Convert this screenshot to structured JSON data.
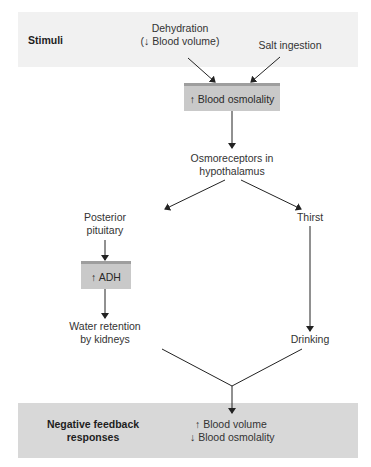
{
  "diagram": {
    "stimuli_band": {
      "label": "Stimuli",
      "items": [
        {
          "line1": "Dehydration",
          "line2": "(↓ Blood volume)"
        },
        {
          "line1": "Salt ingestion"
        }
      ]
    },
    "nodes": {
      "blood_osmolality": "↑ Blood osmolality",
      "osmoreceptors": {
        "line1": "Osmoreceptors in",
        "line2": "hypothalamus"
      },
      "posterior_pituitary": {
        "line1": "Posterior",
        "line2": "pituitary"
      },
      "thirst": "Thirst",
      "adh": "↑ ADH",
      "water_retention": {
        "line1": "Water retention",
        "line2": "by kidneys"
      },
      "drinking": "Drinking"
    },
    "response_band": {
      "label_line1": "Negative feedback",
      "label_line2": "responses",
      "result_line1": "↑ Blood volume",
      "result_line2": "↓ Blood osmolality"
    },
    "colors": {
      "top_band": "#f1f1f1",
      "bottom_band": "#d8d8d8",
      "box_fill": "#c9c9c9",
      "box_top": "#9e9e9e",
      "line": "#222222"
    }
  }
}
